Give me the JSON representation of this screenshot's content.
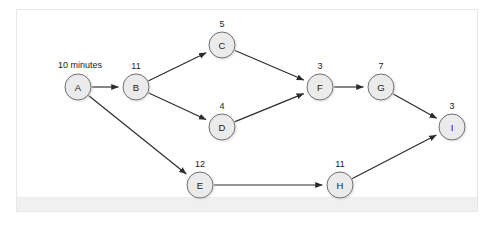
{
  "figure": {
    "type": "activity-on-node-network-diagram",
    "start_label": "10 minutes",
    "node_fill_color": "#ebebeb",
    "node_stroke_color": "#6e6e6e",
    "edge_color": "#2b2b2b",
    "panel_background_color": "#ffffff",
    "panel_border_color": "#e7e7e7",
    "footer_band_color": "#f0f0f0"
  },
  "chart_data": {
    "type": "diagram",
    "title": "",
    "nodes": [
      {
        "id": "A",
        "label": "A",
        "duration": "10 minutes",
        "duration_value": 10,
        "cx": 78,
        "cy": 87,
        "r": 13,
        "duration_pos": "left"
      },
      {
        "id": "B",
        "label": "B",
        "duration": "11",
        "duration_value": 11,
        "cx": 136,
        "cy": 87,
        "r": 13,
        "duration_pos": "above"
      },
      {
        "id": "C",
        "label": "C",
        "duration": "5",
        "duration_value": 5,
        "cx": 222,
        "cy": 45,
        "r": 13,
        "duration_pos": "above"
      },
      {
        "id": "D",
        "label": "D",
        "duration": "4",
        "duration_value": 4,
        "cx": 222,
        "cy": 127,
        "r": 13,
        "duration_pos": "above"
      },
      {
        "id": "E",
        "label": "E",
        "duration": "12",
        "duration_value": 12,
        "cx": 200,
        "cy": 185,
        "r": 13,
        "duration_pos": "above"
      },
      {
        "id": "F",
        "label": "F",
        "duration": "3",
        "duration_value": 3,
        "cx": 320,
        "cy": 87,
        "r": 13,
        "duration_pos": "above"
      },
      {
        "id": "G",
        "label": "G",
        "duration": "7",
        "duration_value": 7,
        "cx": 381,
        "cy": 87,
        "r": 13,
        "duration_pos": "above"
      },
      {
        "id": "H",
        "label": "H",
        "duration": "11",
        "duration_value": 11,
        "cx": 340,
        "cy": 185,
        "r": 13,
        "duration_pos": "above"
      },
      {
        "id": "I",
        "label": "I",
        "duration": "3",
        "duration_value": 3,
        "cx": 452,
        "cy": 127,
        "r": 13,
        "duration_pos": "above"
      }
    ],
    "edges": [
      {
        "from": "A",
        "to": "B"
      },
      {
        "from": "A",
        "to": "E"
      },
      {
        "from": "B",
        "to": "C"
      },
      {
        "from": "B",
        "to": "D"
      },
      {
        "from": "C",
        "to": "F"
      },
      {
        "from": "D",
        "to": "F"
      },
      {
        "from": "E",
        "to": "H"
      },
      {
        "from": "F",
        "to": "G"
      },
      {
        "from": "G",
        "to": "I"
      },
      {
        "from": "H",
        "to": "I"
      }
    ]
  }
}
